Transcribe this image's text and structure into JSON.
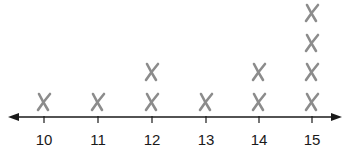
{
  "chart_data": {
    "type": "dot",
    "title": "",
    "xlabel": "",
    "ylabel": "",
    "categories": [
      "10",
      "11",
      "12",
      "13",
      "14",
      "15"
    ],
    "values": [
      1,
      1,
      2,
      1,
      2,
      4
    ],
    "marker": "X",
    "xlim": [
      10,
      15
    ],
    "axis_arrows": true,
    "grid": false
  },
  "colors": {
    "marker": "#8c8c8c",
    "axis": "#1a1a1a"
  },
  "layout": {
    "axis_y": 117,
    "tick_x": [
      44,
      98,
      152,
      206,
      259,
      312
    ],
    "row_y": [
      102,
      72,
      43,
      13
    ]
  }
}
